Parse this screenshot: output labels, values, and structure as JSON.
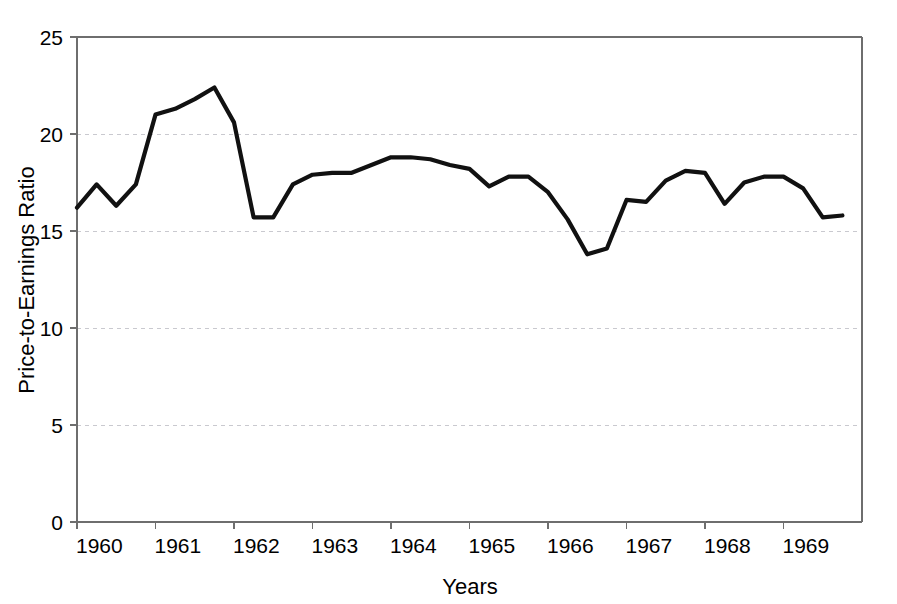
{
  "chart_data": {
    "type": "line",
    "title": "",
    "xlabel": "Years",
    "ylabel": "Price-to-Earnings Ratio",
    "xlim": [
      1960,
      1970
    ],
    "ylim": [
      0,
      25
    ],
    "yticks": [
      0,
      5,
      10,
      15,
      20,
      25
    ],
    "ytick_labels": [
      "0",
      "5",
      "10",
      "15",
      "20",
      "25"
    ],
    "xticks": [
      1960,
      1961,
      1962,
      1963,
      1964,
      1965,
      1966,
      1967,
      1968,
      1969
    ],
    "xtick_labels": [
      "1960",
      "1961",
      "1962",
      "1963",
      "1964",
      "1965",
      "1966",
      "1967",
      "1968",
      "1969"
    ],
    "grid": "horizontal-dashed",
    "legend": "none",
    "line_color": "#111111",
    "grid_color": "#c9c9cf",
    "axis_color": "#6e6e6e",
    "background_color": "#ffffff",
    "series": [
      {
        "name": "Price-to-Earnings Ratio",
        "x": [
          1960.0,
          1960.25,
          1960.5,
          1960.75,
          1961.0,
          1961.25,
          1961.5,
          1961.75,
          1962.0,
          1962.25,
          1962.5,
          1962.75,
          1963.0,
          1963.25,
          1963.5,
          1963.75,
          1964.0,
          1964.25,
          1964.5,
          1964.75,
          1965.0,
          1965.25,
          1965.5,
          1965.75,
          1966.0,
          1966.25,
          1966.5,
          1966.75,
          1967.0,
          1967.25,
          1967.5,
          1967.75,
          1968.0,
          1968.25,
          1968.5,
          1968.75,
          1969.0,
          1969.25,
          1969.5,
          1969.75
        ],
        "y": [
          16.2,
          17.4,
          16.3,
          17.4,
          21.0,
          21.3,
          21.8,
          22.4,
          20.6,
          15.7,
          15.7,
          17.4,
          17.9,
          18.0,
          18.0,
          18.4,
          18.8,
          18.8,
          18.7,
          18.4,
          18.2,
          17.3,
          17.8,
          17.8,
          17.0,
          15.6,
          13.8,
          14.1,
          16.6,
          16.5,
          17.6,
          18.1,
          18.0,
          16.4,
          17.5,
          17.8,
          17.8,
          17.2,
          15.7,
          15.8
        ]
      }
    ]
  }
}
